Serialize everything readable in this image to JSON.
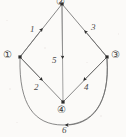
{
  "diagram": {
    "type": "directed-graph",
    "title": "",
    "background_color": "#fbfaf8",
    "line_color": "#6b6b6b",
    "node_marker_color": "#2b2b2b",
    "label_color": "#3a3a3a",
    "nodes": [
      {
        "id": "n2",
        "label": "②",
        "plain": "2",
        "x": 62,
        "y": 4,
        "label_x": 56,
        "label_y": 0
      },
      {
        "id": "n1",
        "label": "①",
        "plain": "1",
        "x": 20,
        "y": 57,
        "label_x": 3,
        "label_y": 51
      },
      {
        "id": "n3",
        "label": "③",
        "plain": "3",
        "x": 107,
        "y": 57,
        "label_x": 111,
        "label_y": 51
      },
      {
        "id": "n4",
        "label": "④",
        "plain": "4",
        "x": 63,
        "y": 102,
        "label_x": 57,
        "label_y": 105
      }
    ],
    "edges": [
      {
        "id": "e1",
        "label": "1",
        "from": "1",
        "to": "2",
        "label_x": 30,
        "label_y": 25
      },
      {
        "id": "e2",
        "label": "2",
        "from": "1",
        "to": "4",
        "label_x": 34,
        "label_y": 83
      },
      {
        "id": "e3",
        "label": "3",
        "from": "3",
        "to": "2",
        "label_x": 91,
        "label_y": 23
      },
      {
        "id": "e4",
        "label": "4",
        "from": "3",
        "to": "4",
        "label_x": 84,
        "label_y": 83
      },
      {
        "id": "e5",
        "label": "5",
        "from": "2",
        "to": "4",
        "label_x": 52,
        "label_y": 56
      },
      {
        "id": "e6",
        "label": "6",
        "from": "3",
        "to": "1",
        "label_x": 62,
        "label_y": 126
      }
    ]
  }
}
